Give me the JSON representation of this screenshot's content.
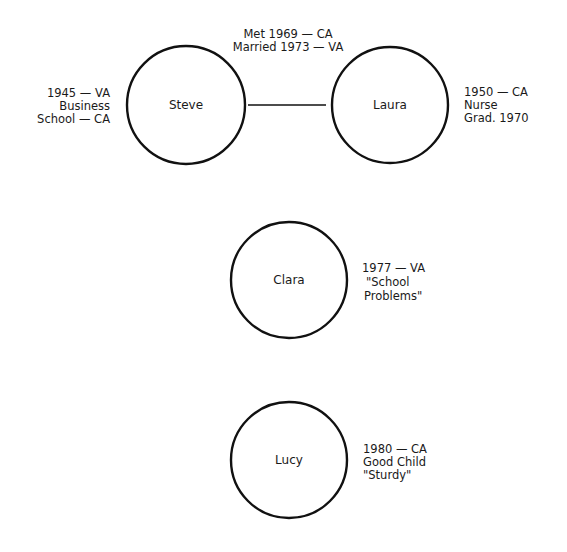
{
  "diagram": {
    "type": "genogram",
    "people": [
      {
        "id": "steve",
        "name": "Steve",
        "notes": [
          "1945 — VA",
          "Business",
          "School — CA"
        ],
        "notes_side": "left"
      },
      {
        "id": "laura",
        "name": "Laura",
        "notes": [
          "1950 — CA",
          "Nurse",
          "Grad. 1970"
        ],
        "notes_side": "right"
      },
      {
        "id": "clara",
        "name": "Clara",
        "notes": [
          "1977 — VA",
          "\"School",
          "Problems\""
        ],
        "notes_side": "right"
      },
      {
        "id": "lucy",
        "name": "Lucy",
        "notes": [
          "1980 — CA",
          "Good Child",
          "\"Sturdy\""
        ],
        "notes_side": "right"
      }
    ],
    "relationship": {
      "from": "steve",
      "to": "laura",
      "notes": [
        "Met 1969 — CA",
        "Married 1973 — VA"
      ]
    }
  }
}
